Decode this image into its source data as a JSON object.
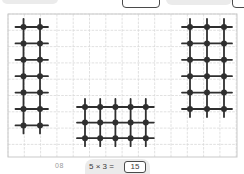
{
  "colors": {
    "background": "#ffffff",
    "grid_line": "#d9d9d9",
    "grid_border": "#c9c9c9",
    "dot": "#2f2f2f",
    "pill_bg": "#ebebeb",
    "answer_border": "#4a4a4a",
    "text_dark": "#3a3a3a",
    "text_muted": "#9a9a9a"
  },
  "question": {
    "number": "08",
    "equation_text": "5 × 3 =",
    "answer": "15"
  },
  "grid": {
    "x": 8,
    "y": 14,
    "width": 229,
    "height": 143,
    "cell": 16.3
  },
  "arrays": [
    {
      "name": "dot-array-2x7",
      "columns": 2,
      "rows": 7,
      "dot_count": 14,
      "x": 23.5,
      "y": 27,
      "dx": 16.5,
      "dy": 16.4
    },
    {
      "name": "dot-array-5x3",
      "columns": 5,
      "rows": 3,
      "dot_count": 15,
      "x": 85,
      "y": 107,
      "dx": 15.2,
      "dy": 15.6
    },
    {
      "name": "dot-array-3x6",
      "columns": 3,
      "rows": 6,
      "dot_count": 18,
      "x": 190,
      "y": 27,
      "dx": 17,
      "dy": 16.4
    }
  ],
  "style": {
    "dot_radius": 3,
    "line_width": 1.8,
    "whisker": 8
  }
}
